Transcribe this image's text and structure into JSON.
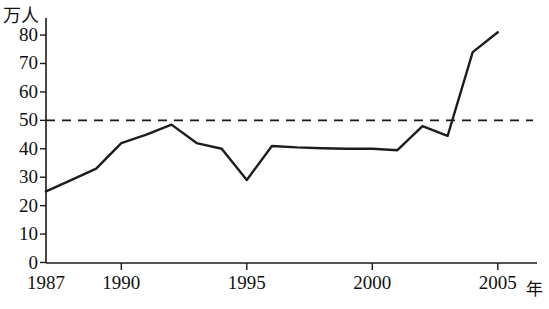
{
  "chart_data": {
    "type": "line",
    "title": "",
    "xlabel": "年",
    "ylabel": "万人",
    "x": [
      1987,
      1988,
      1989,
      1990,
      1991,
      1992,
      1993,
      1994,
      1995,
      1996,
      1997,
      1998,
      1999,
      2000,
      2001,
      2002,
      2003,
      2004,
      2005
    ],
    "values": [
      25,
      29,
      33,
      42,
      45,
      48.5,
      42,
      40,
      29,
      41,
      40.5,
      40.2,
      40,
      40,
      39.5,
      48,
      44.5,
      74,
      81
    ],
    "series": [
      {
        "name": "人数",
        "values": [
          25,
          29,
          33,
          42,
          45,
          48.5,
          42,
          40,
          29,
          41,
          40.5,
          40.2,
          40,
          40,
          39.5,
          48,
          44.5,
          74,
          81
        ]
      }
    ],
    "xlim": [
      1987,
      2005.2
    ],
    "ylim": [
      0,
      85
    ],
    "xticks": [
      1987,
      1990,
      1995,
      2000,
      2005
    ],
    "xtick_labels": [
      "1987",
      "1990",
      "1995",
      "2000",
      "2005"
    ],
    "yticks": [
      0,
      10,
      20,
      30,
      40,
      50,
      60,
      70,
      80
    ],
    "ytick_labels": [
      "0",
      "10",
      "20",
      "30",
      "40",
      "50",
      "60",
      "70",
      "80"
    ],
    "grid": false,
    "legend": "none",
    "annotations": [
      {
        "name": "reference-line",
        "type": "horizontal-dashed",
        "value": 50,
        "label": ""
      }
    ]
  },
  "axes": {
    "y_unit": "万人",
    "x_unit": "年"
  },
  "caption": {
    "text": ""
  }
}
